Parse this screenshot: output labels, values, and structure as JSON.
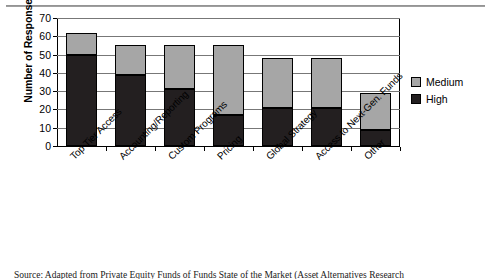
{
  "figure": {
    "caption": "Source: Adapted from Private Equity Funds of Funds State of the Market (Asset Alternatives Research"
  },
  "legend": {
    "position": "right",
    "items": [
      {
        "label": "Medium",
        "color": "#a6a6a6",
        "swatch_name": "legend-swatch-medium"
      },
      {
        "label": "High",
        "color": "#231f20",
        "swatch_name": "legend-swatch-high"
      }
    ]
  },
  "chart_data": {
    "type": "bar",
    "subtype": "stacked-bar",
    "title": "",
    "xlabel": "",
    "ylabel": "Number of Responses",
    "ylim": [
      0,
      70
    ],
    "ytick_step": 10,
    "yticks": [
      0,
      10,
      20,
      30,
      40,
      50,
      60,
      70
    ],
    "ytick_labels": [
      "0",
      "10",
      "20",
      "30",
      "40",
      "50",
      "60",
      "70"
    ],
    "grid": true,
    "grid_axis": "y",
    "legend_position": "right",
    "categories": [
      "Top Tier Access",
      "Accounting/Reporting",
      "Custom Programs",
      "Pricing",
      "Global Strategy",
      "Access to Next-Gen. Funds",
      "Other"
    ],
    "series": [
      {
        "name": "High",
        "color": "#231f20",
        "values": [
          50,
          39,
          31,
          17,
          21,
          21,
          9
        ]
      },
      {
        "name": "Medium",
        "color": "#a6a6a6",
        "values": [
          12,
          16,
          24,
          38,
          27,
          27,
          20
        ]
      }
    ],
    "totals": [
      62,
      55,
      55,
      55,
      48,
      48,
      29
    ]
  }
}
